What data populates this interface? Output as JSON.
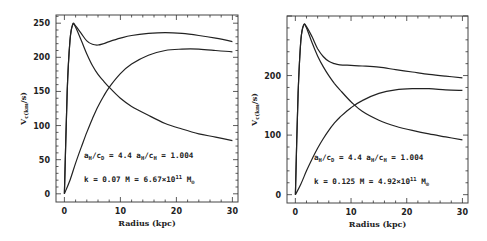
{
  "chart_data": [
    {
      "type": "line",
      "title": "",
      "xlabel": "Radius (kpc)",
      "ylabel": "V_c(km/s)",
      "xlim": [
        -1.5,
        31
      ],
      "ylim": [
        -12,
        262
      ],
      "xticks": [
        0,
        10,
        20,
        30
      ],
      "yticks": [
        0,
        50,
        100,
        150,
        200,
        250
      ],
      "grid": false,
      "legend": null,
      "annotations": [
        "a_H/c_D = 4.4  a_H/c_H = 1.004",
        "k = 0.07     M = 6.67×10^11 M_⊙"
      ],
      "series": [
        {
          "name": "Total",
          "x": [
            0,
            0.5,
            1,
            1.5,
            2,
            3,
            4,
            5,
            6,
            7,
            8,
            10,
            12,
            15,
            18,
            21,
            24,
            27,
            30
          ],
          "values": [
            0,
            150,
            225,
            248,
            246,
            235,
            224,
            219,
            218,
            220,
            223,
            228,
            232,
            235,
            236,
            235,
            232,
            228,
            223
          ]
        },
        {
          "name": "Disk",
          "x": [
            0,
            0.5,
            1,
            1.5,
            2,
            3,
            4,
            5,
            6,
            7,
            8,
            10,
            12,
            15,
            18,
            21,
            24,
            27,
            30
          ],
          "values": [
            0,
            150,
            225,
            249,
            244,
            225,
            205,
            188,
            175,
            165,
            156,
            140,
            128,
            115,
            103,
            95,
            88,
            83,
            78
          ]
        },
        {
          "name": "Halo",
          "x": [
            0,
            1,
            2,
            3,
            4,
            5,
            6,
            7,
            8,
            10,
            12,
            15,
            18,
            21,
            24,
            27,
            30
          ],
          "values": [
            0,
            20,
            45,
            68,
            90,
            110,
            128,
            143,
            156,
            176,
            190,
            203,
            210,
            212,
            212,
            210,
            208
          ]
        }
      ]
    },
    {
      "type": "line",
      "title": "",
      "xlabel": "Radius (kpc)",
      "ylabel": "V_c(km/s)",
      "xlim": [
        -1.5,
        31
      ],
      "ylim": [
        -14,
        300
      ],
      "xticks": [
        0,
        10,
        20,
        30
      ],
      "yticks": [
        0,
        100,
        200
      ],
      "grid": false,
      "legend": null,
      "annotations": [
        "a_H/c_D = 4.4  a_H/c_H = 1.004",
        "k = 0.125    M = 4.92×10^11 M_⊙"
      ],
      "series": [
        {
          "name": "Total",
          "x": [
            0,
            0.5,
            1,
            1.5,
            2,
            3,
            4,
            5,
            6,
            7,
            8,
            10,
            12,
            15,
            18,
            21,
            24,
            27,
            30
          ],
          "values": [
            0,
            170,
            260,
            285,
            282,
            265,
            245,
            232,
            224,
            220,
            218,
            217,
            216,
            214,
            210,
            206,
            202,
            199,
            196
          ]
        },
        {
          "name": "Disk",
          "x": [
            0,
            0.5,
            1,
            1.5,
            2,
            3,
            4,
            5,
            6,
            7,
            8,
            10,
            12,
            15,
            18,
            21,
            24,
            27,
            30
          ],
          "values": [
            0,
            170,
            260,
            285,
            280,
            255,
            233,
            215,
            200,
            187,
            176,
            156,
            140,
            125,
            115,
            108,
            102,
            97,
            92
          ]
        },
        {
          "name": "Halo",
          "x": [
            0,
            1,
            2,
            3,
            4,
            5,
            6,
            7,
            8,
            10,
            12,
            15,
            18,
            21,
            24,
            27,
            30
          ],
          "values": [
            0,
            18,
            40,
            60,
            78,
            94,
            108,
            120,
            130,
            146,
            158,
            170,
            176,
            178,
            178,
            176,
            175
          ]
        }
      ]
    }
  ],
  "panels": [
    {
      "frame": {
        "x": 56,
        "y": 15,
        "w": 182,
        "h": 187
      },
      "ytick_labels": [
        "0",
        "50",
        "100",
        "150",
        "200",
        "250"
      ],
      "xtick_labels": [
        "0",
        "10",
        "20",
        "30"
      ],
      "ylabel": "V_c(km/s)",
      "xlabel": "Radius (kpc)",
      "annot1": "a_H/c_D = 4.4  a_H/c_H = 1.004",
      "annot2": "k = 0.07     M = 6.67×10^11 M_⊙"
    },
    {
      "frame": {
        "x": 287,
        "y": 16,
        "w": 181,
        "h": 187
      },
      "ytick_labels": [
        "0",
        "100",
        "200"
      ],
      "xtick_labels": [
        "0",
        "10",
        "20",
        "30"
      ],
      "ylabel": "V_c(km/s)",
      "xlabel": "Radius (kpc)",
      "annot1": "a_H/c_D = 4.4  a_H/c_H = 1.004",
      "annot2": "k = 0.125    M = 4.92×10^11 M_⊙"
    }
  ]
}
